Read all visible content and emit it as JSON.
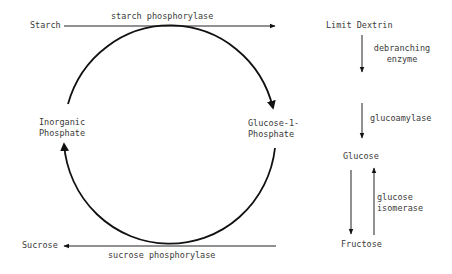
{
  "diagram": {
    "nodes": {
      "starch": "Starch",
      "limit_dextrin": "Limit Dextrin",
      "inorganic_phosphate_1": "Inorganic",
      "inorganic_phosphate_2": "Phosphate",
      "g1p_1": "Glucose-1-",
      "g1p_2": "Phosphate",
      "glucose": "Glucose",
      "fructose": "Fructose",
      "sucrose": "Sucrose"
    },
    "enzymes": {
      "starch_phosphorylase": "starch phosphorylase",
      "sucrose_phosphorylase": "sucrose phosphorylase",
      "debranching_1": "debranching",
      "debranching_2": "enzyme",
      "glucoamylase": "glucoamylase",
      "isomerase_1": "glucose",
      "isomerase_2": "isomerase"
    },
    "edges": [
      {
        "from": "Starch",
        "to": "Limit Dextrin",
        "label": "starch phosphorylase"
      },
      {
        "from": "Limit Dextrin",
        "to": "(debranched)",
        "label": "debranching enzyme"
      },
      {
        "from": "(glucose-1-phosphate pathway)",
        "to": "Glucose",
        "label": "glucoamylase"
      },
      {
        "from": "Glucose",
        "to": "Fructose",
        "label": ""
      },
      {
        "from": "Fructose",
        "to": "Glucose",
        "label": "glucose isomerase"
      },
      {
        "from": "Fructose",
        "to": "Sucrose",
        "label": "sucrose phosphorylase"
      },
      {
        "from": "Inorganic Phosphate",
        "to": "Glucose-1-Phosphate",
        "label": "cycle (clockwise)"
      }
    ]
  }
}
